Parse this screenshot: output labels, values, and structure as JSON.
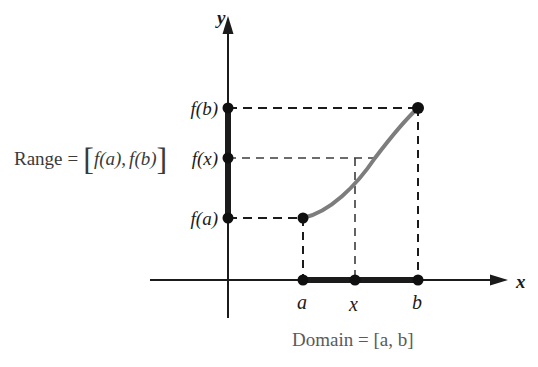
{
  "figure": {
    "background_color": "#ffffff"
  },
  "axes": {
    "y_axis_label": "y",
    "x_axis_label": "x",
    "axis_color": "#1b1b1b",
    "origin": {
      "x": 228,
      "y": 280
    }
  },
  "y_ticks": [
    {
      "name": "f-of-b",
      "label_prefix": "f",
      "label_arg": "(b)",
      "label": "f(b)",
      "y": 108
    },
    {
      "name": "f-of-x",
      "label_prefix": "f",
      "label_arg": "(x)",
      "label": "f(x)",
      "y": 158
    },
    {
      "name": "f-of-a",
      "label_prefix": "f",
      "label_arg": "(a)",
      "label": "f(a)",
      "y": 218
    }
  ],
  "x_ticks": [
    {
      "name": "a",
      "label": "a",
      "x": 303
    },
    {
      "name": "x",
      "label": "x",
      "x": 355
    },
    {
      "name": "b",
      "label": "b",
      "x": 418
    }
  ],
  "range_annotation": {
    "word": "Range",
    "equals": "=",
    "bracket_open": "[",
    "first": "f(a)",
    "comma": ",",
    "second": "f(b)",
    "bracket_close": "]",
    "full_text": "Range = [f(a), f(b)]",
    "color": "#3a3a3a"
  },
  "domain_annotation": {
    "text": "Domain = [a, b]",
    "color": "#5a5a5a"
  },
  "curve": {
    "color": "#7d7d7d",
    "description": "increasing concave-down curve from (a, f(a)) to (b, f(b))",
    "path": "M 303,218 C 330,212 356,186 375,158 C 394,133 407,118 418,108"
  },
  "range_segment": {
    "color": "#1b1b1b",
    "from_y": 108,
    "to_y": 218,
    "axis_x": 228
  },
  "domain_segment": {
    "color": "#1b1b1b",
    "from_x": 303,
    "to_x": 418,
    "axis_y": 280
  },
  "guide_lines": [
    {
      "name": "fb-horizontal",
      "from": [
        228,
        108
      ],
      "to": [
        418,
        108
      ]
    },
    {
      "name": "fx-horizontal",
      "from": [
        228,
        158
      ],
      "to": [
        375,
        158
      ]
    },
    {
      "name": "fa-horizontal",
      "from": [
        228,
        218
      ],
      "to": [
        303,
        218
      ]
    },
    {
      "name": "a-vertical",
      "from": [
        303,
        218
      ],
      "to": [
        303,
        280
      ]
    },
    {
      "name": "x-vertical",
      "from": [
        355,
        158
      ],
      "to": [
        355,
        280
      ]
    },
    {
      "name": "b-vertical",
      "from": [
        418,
        108
      ],
      "to": [
        418,
        280
      ]
    }
  ],
  "points": [
    {
      "name": "point-fb-on-axis",
      "x": 228,
      "y": 108
    },
    {
      "name": "point-fx-on-axis",
      "x": 228,
      "y": 158
    },
    {
      "name": "point-fa-on-axis",
      "x": 228,
      "y": 218
    },
    {
      "name": "point-a-fa-on-curve",
      "x": 303,
      "y": 218
    },
    {
      "name": "point-b-fb-on-curve",
      "x": 418,
      "y": 108
    },
    {
      "name": "point-a-on-x-axis",
      "x": 303,
      "y": 280
    },
    {
      "name": "point-x-on-x-axis",
      "x": 355,
      "y": 280
    },
    {
      "name": "point-b-on-x-axis",
      "x": 418,
      "y": 280
    }
  ]
}
